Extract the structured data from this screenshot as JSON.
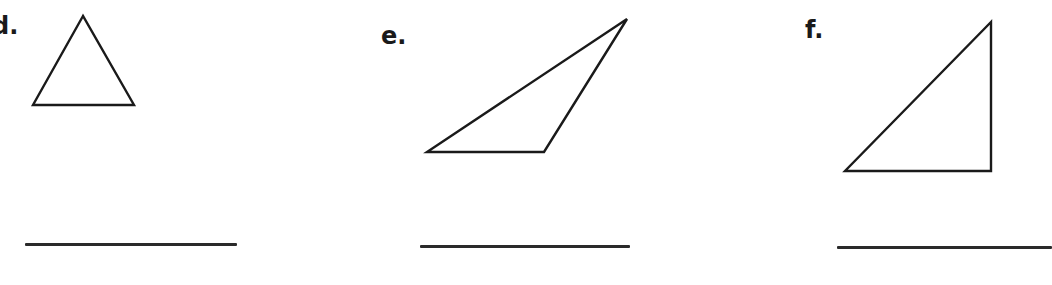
{
  "worksheet": {
    "problems": [
      {
        "id": "d",
        "label": "d.",
        "shape": "triangle",
        "appearance": "equilateral/acute",
        "answer": ""
      },
      {
        "id": "e",
        "label": "e.",
        "shape": "triangle",
        "appearance": "obtuse",
        "answer": ""
      },
      {
        "id": "f",
        "label": "f.",
        "shape": "triangle",
        "appearance": "right",
        "answer": ""
      }
    ]
  },
  "colors": {
    "ink": "#1a1a1a",
    "line": "#2a2a2a",
    "background": "#ffffff"
  }
}
